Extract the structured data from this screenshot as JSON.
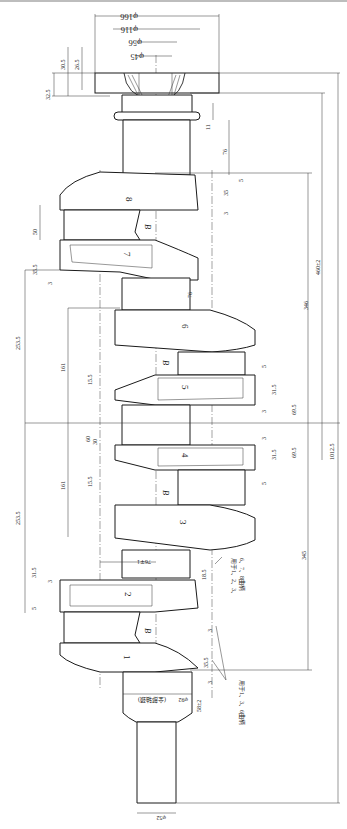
{
  "drawing": {
    "title": "Crankshaft forging drawing",
    "throws": [
      "1",
      "2",
      "3",
      "4",
      "5",
      "6",
      "7",
      "8"
    ],
    "web_marker": "B",
    "dimensions": {
      "flange_od": "φ166",
      "flange_od_tol": "+1 −1.5",
      "bore_116": "φ116",
      "bore_116_tol": "+3 −1.5",
      "bore_56": "φ56",
      "bore_56_tol": "+1 −1",
      "bore_45": "φ45",
      "bore_45_tol": "+1 −1",
      "flange_thk_32": "32.5",
      "flange_thk_32_tol": "+1.5 −2",
      "flange_30": "30.5",
      "flange_30_tol": "+3 −2",
      "flange_26": "26.5",
      "flange_26_tol": "+3 −2",
      "d11": "11",
      "d11_tol": "+1.5 −1",
      "d76_top": "76",
      "d76_top_tol": "+1 −2",
      "d35_top": "35",
      "d5_top": "5",
      "d3_top": "3",
      "d50": "50",
      "d50_tol": "+1 −2",
      "d35_5_a": "35.5",
      "d35_5_a_tol": "+2 −1.5",
      "d3_a": "3",
      "d460": "460±2",
      "d76_mid": "76",
      "d76_mid_tol": "+1.5 −1",
      "d253_top": "253.5",
      "d253_top_tol": "+1.5 −1",
      "d346": "346",
      "d346_tol": "+1.5 −1",
      "d161_top": "161",
      "d161_top_tol": "+1.5 −1",
      "d15_5_top": "15.5",
      "d15_5_top_tol": "+1.5 −1",
      "d5_mid": "5",
      "d31_5_r1": "31.5",
      "d31_5_r1_tol": "+2 −1",
      "d69_5_r1": "69.5",
      "d69_5_r1_tol": "+1.5 −1",
      "d3_mid": "3",
      "d60": "60",
      "d60_tol": "+1 −1",
      "d30": "30",
      "d1012": "1012.5",
      "d1012_tol": "+4 −2",
      "d161_bot": "161",
      "d161_bot_tol": "+1.5 −1",
      "d15_5_bot": "15.5",
      "d15_5_bot_tol": "+1.5 −1",
      "d3_r2": "3",
      "d31_5_r2": "31.5",
      "d31_5_r2_tol": "+2 −1",
      "d69_5_r2": "69.5",
      "d69_5_r2_tol": "+1.5 −1",
      "d5_r2": "5",
      "d253_bot": "253.5",
      "d253_bot_tol": "+1.5 −1",
      "d345": "345",
      "d345_tol": "+1.5 −1",
      "d31_5_left": "31.5",
      "d31_5_left_tol": "+2 −1",
      "d3_left": "3",
      "d5_left": "5",
      "d76_bot": "76∓1",
      "d18_5": "18.5",
      "d18_5_tol": "+1.5 −1",
      "note_a": "用于1、2、3、",
      "note_b": "6、7、8曲柄",
      "d3_lower": "3",
      "d35_5_lower": "35.5",
      "d35_5_lower_tol": "+3 −2",
      "d3_lowest": "3",
      "d58": "58±2",
      "journal_92": "φ92",
      "journal_92_tol": "+3 −1.5",
      "journal_92_note": "(全部轴颈)",
      "note_c": "用于1、3、6曲柄",
      "nose_52": "φ52",
      "nose_52_tol": "+3 −1.5"
    }
  }
}
